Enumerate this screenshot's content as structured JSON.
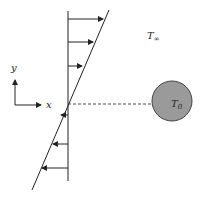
{
  "diagram": {
    "labels": {
      "y_axis": "y",
      "x_axis": "x",
      "ambient_temp": "T",
      "ambient_temp_sub": "∞",
      "body_temp": "T",
      "body_temp_sub": "0"
    },
    "colors": {
      "stroke": "#222222",
      "sphere_fill": "#9a9a9a",
      "sphere_stroke": "#444444"
    }
  }
}
